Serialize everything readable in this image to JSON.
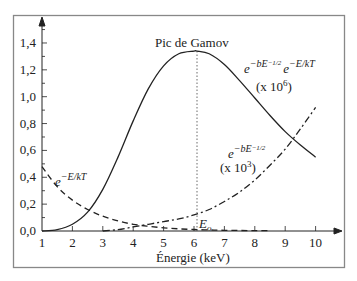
{
  "chart_data": {
    "type": "line",
    "title": "",
    "xlabel": "Énergie (keV)",
    "ylabel": "",
    "xlim": [
      1,
      10.8
    ],
    "ylim": [
      0,
      1.55
    ],
    "x_ticks": [
      "1",
      "2",
      "3",
      "4",
      "5",
      "6",
      "7",
      "8",
      "9",
      "10"
    ],
    "y_ticks": [
      "0,0",
      "0,2",
      "0,4",
      "0,6",
      "0,8",
      "1,0",
      "1,2",
      "1,4"
    ],
    "grid": false,
    "legend": "none (inline annotations)",
    "series": [
      {
        "name": "e^{-bE^{-1/2}} e^{-E/kT} (x 10^6)",
        "style": "solid",
        "x": [
          1.0,
          1.5,
          2.0,
          2.5,
          3.0,
          3.5,
          4.0,
          4.5,
          5.0,
          5.5,
          6.0,
          6.1,
          6.5,
          7.0,
          7.5,
          8.0,
          8.5,
          9.0,
          9.5,
          10.0
        ],
        "values": [
          0.0,
          0.01,
          0.05,
          0.14,
          0.31,
          0.55,
          0.82,
          1.06,
          1.23,
          1.32,
          1.34,
          1.34,
          1.32,
          1.24,
          1.12,
          0.99,
          0.86,
          0.74,
          0.64,
          0.55
        ]
      },
      {
        "name": "e^{-E/kT}",
        "style": "dashed",
        "x": [
          1.0,
          1.5,
          2.0,
          2.5,
          3.0,
          3.5,
          4.0,
          4.5,
          5.0,
          5.5,
          6.0,
          6.5,
          7.0,
          7.5,
          8.0,
          8.5
        ],
        "values": [
          0.48,
          0.33,
          0.23,
          0.16,
          0.11,
          0.075,
          0.05,
          0.035,
          0.024,
          0.016,
          0.011,
          0.008,
          0.005,
          0.004,
          0.003,
          0.002
        ]
      },
      {
        "name": "e^{-bE^{-1/2}} (x 10^3)",
        "style": "dash-dot",
        "x": [
          3.0,
          3.5,
          4.0,
          4.5,
          5.0,
          5.5,
          6.0,
          6.5,
          7.0,
          7.5,
          8.0,
          8.5,
          9.0,
          9.5,
          10.0
        ],
        "values": [
          0.0,
          0.01,
          0.03,
          0.05,
          0.07,
          0.09,
          0.12,
          0.16,
          0.22,
          0.29,
          0.38,
          0.49,
          0.61,
          0.76,
          0.92
        ]
      }
    ],
    "annotations": [
      {
        "text": "Pic de Gamov",
        "x": 6.1,
        "y": 1.34
      },
      {
        "text": "E0",
        "x": 6.1,
        "y": 0.0,
        "note": "dotted vertical line at peak"
      },
      {
        "text": "(x 10^6)",
        "series": 0
      },
      {
        "text": "(x 10^3)",
        "series": 2
      }
    ]
  },
  "labels": {
    "peak": "Pic de Gamov",
    "xaxis": "Énergie (keV)",
    "e0_base": "E",
    "e0_sub": "o",
    "gamov_e1": "e",
    "gamov_sup1": "−bE",
    "gamov_sup1b": "−1/2",
    "gamov_e2": "e",
    "gamov_sup2": "−E/kT",
    "gamov_scale": "(x 10",
    "gamov_scale_exp": "6",
    "gamov_scale_end": ")",
    "tunnel_e": "e",
    "tunnel_sup": "−bE",
    "tunnel_supb": "−1/2",
    "tunnel_scale": "(x 10",
    "tunnel_scale_exp": "3",
    "tunnel_scale_end": ")",
    "boltz_e": "e",
    "boltz_sup": "−E/kT"
  }
}
